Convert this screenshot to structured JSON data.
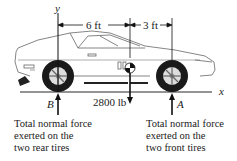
{
  "figure": {
    "type": "free-body diagram",
    "axes": {
      "y_label": "y",
      "x_label": "x"
    },
    "dimensions": [
      {
        "label": "6 ft",
        "from": "rear axle (y-axis)",
        "to": "center of gravity"
      },
      {
        "label": "3 ft",
        "from": "center of gravity",
        "to": "front axle"
      }
    ],
    "forces": {
      "weight": {
        "label": "2800 lb",
        "direction": "down"
      },
      "rear": {
        "label": "B",
        "direction": "up"
      },
      "front": {
        "label": "A",
        "direction": "up"
      }
    },
    "captions": {
      "rear": [
        "Total normal force",
        "exerted on the",
        "two rear tires"
      ],
      "front": [
        "Total normal force",
        "exerted on the",
        "two front tires"
      ]
    }
  }
}
